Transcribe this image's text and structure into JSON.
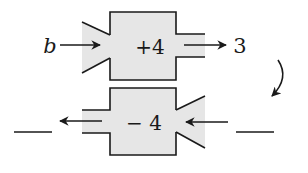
{
  "diagram": {
    "type": "function-machine",
    "colors": {
      "machine_fill": "#e6e6e6",
      "stroke": "#1a1a1a",
      "background": "#ffffff"
    },
    "top_machine": {
      "input": "b",
      "operation": "+4",
      "output": "3"
    },
    "bottom_machine": {
      "input": "",
      "operation": "− 4",
      "output": ""
    },
    "connector": "curved-arrow-down"
  }
}
